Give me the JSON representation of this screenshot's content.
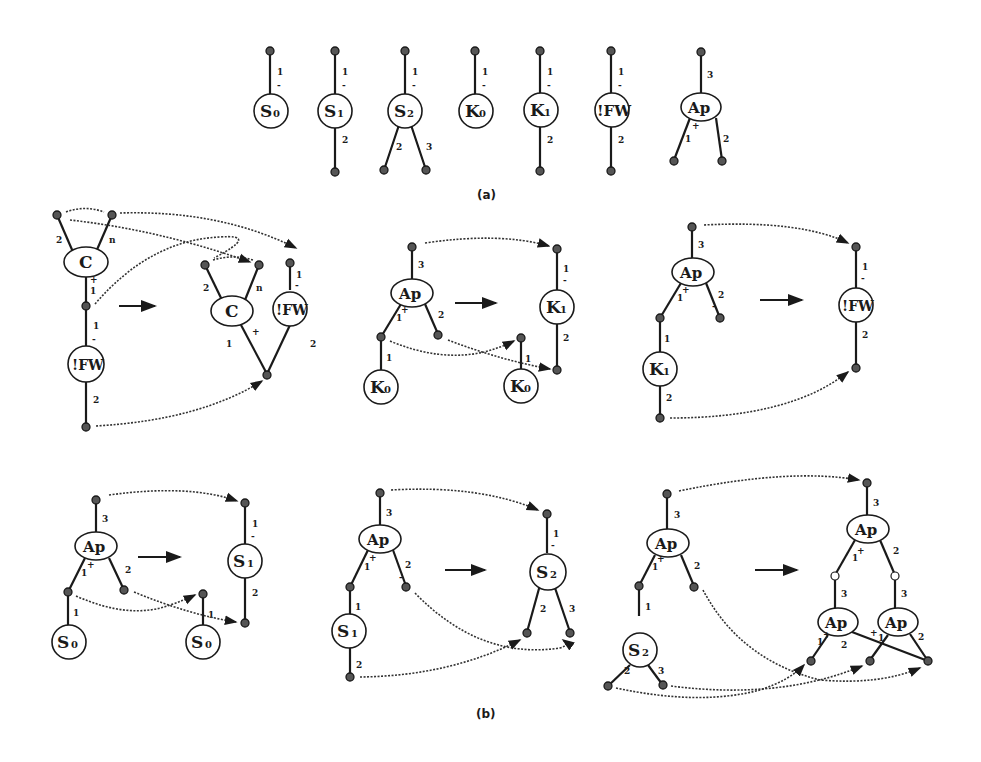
{
  "figure": {
    "part_a_caption": "(a)",
    "part_b_caption": "(b)"
  },
  "agents_a": [
    {
      "name": "S",
      "sub": "0",
      "ports": {
        "principal": "1",
        "principal_mark": "-"
      }
    },
    {
      "name": "S",
      "sub": "1",
      "ports": {
        "principal": "1",
        "principal_mark": "-",
        "aux": [
          "2"
        ]
      }
    },
    {
      "name": "S",
      "sub": "2",
      "ports": {
        "principal": "1",
        "principal_mark": "-",
        "aux": [
          "2",
          "3"
        ]
      }
    },
    {
      "name": "K",
      "sub": "0",
      "ports": {
        "principal": "1",
        "principal_mark": "-"
      }
    },
    {
      "name": "K",
      "sub": "1",
      "ports": {
        "principal": "1",
        "principal_mark": "-",
        "aux": [
          "2"
        ]
      }
    },
    {
      "name": "!FW",
      "sub": "",
      "ports": {
        "principal": "1",
        "principal_mark": "-",
        "aux": [
          "2"
        ]
      }
    },
    {
      "name": "Ap",
      "sub": "",
      "ports": {
        "top": "3",
        "aux": [
          "1",
          "2"
        ],
        "aux_mark": "+"
      }
    }
  ],
  "rules_b": [
    {
      "lhs": "C / !FW",
      "rhs": "C , !FW",
      "labels": [
        "2",
        "n",
        "+",
        "1",
        "1",
        "-",
        "2",
        "2",
        "n",
        "1",
        "+",
        "1",
        "-",
        "2"
      ]
    },
    {
      "lhs": "Ap(K0)",
      "rhs": "K1 , K0",
      "labels": [
        "3",
        "1",
        "+",
        "2",
        "1",
        "1",
        "-",
        "2",
        "1"
      ]
    },
    {
      "lhs": "Ap(K1)",
      "rhs": "!FW",
      "labels": [
        "3",
        "1",
        "+",
        "2",
        "-",
        "1",
        "2",
        "1",
        "-",
        "2"
      ]
    },
    {
      "lhs": "Ap(S0)",
      "rhs": "S1 , S0",
      "labels": [
        "3",
        "1",
        "+",
        "2",
        "1",
        "1",
        "-",
        "2",
        "1"
      ]
    },
    {
      "lhs": "Ap(S1)",
      "rhs": "S2",
      "labels": [
        "3",
        "1",
        "+",
        "2",
        "-",
        "1",
        "2",
        "1",
        "-",
        "2",
        "3"
      ]
    },
    {
      "lhs": "Ap(S2)",
      "rhs": "Ap(Ap, Ap)",
      "labels": [
        "3",
        "1",
        "+",
        "2",
        "1",
        "2",
        "3",
        "3",
        "1",
        "+",
        "2",
        "3",
        "2",
        "3",
        "1",
        "2",
        "+",
        "1",
        "2"
      ]
    }
  ],
  "text": {
    "S": "S",
    "K": "K",
    "C": "C",
    "Ap": "Ap",
    "FW": "!FW",
    "n0": "0",
    "n1": "1",
    "n2": "2",
    "n3": "3",
    "n": "n",
    "plus": "+",
    "minus": "-"
  }
}
